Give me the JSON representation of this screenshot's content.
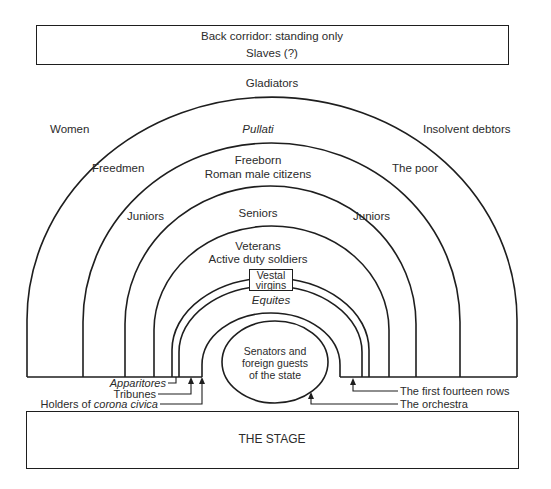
{
  "top_box": {
    "line1": "Back corridor: standing only",
    "line2": "Slaves (?)"
  },
  "tiers": {
    "outer_top": "Gladiators",
    "outer_left": "Women",
    "outer_center": "Pullati",
    "outer_right": "Insolvent debtors",
    "second_left": "Freedmen",
    "second_center_line1": "Freeborn",
    "second_center_line2": "Roman male citizens",
    "second_right": "The poor",
    "third_left": "Juniors",
    "third_center": "Seniors",
    "third_right": "Juniors",
    "fourth_center_line1": "Veterans",
    "fourth_center_line2": "Active duty soldiers",
    "vestal_line1": "Vestal",
    "vestal_line2": "virgins",
    "equites": "Equites"
  },
  "orchestra": {
    "line1": "Senators and",
    "line2": "foreign guests",
    "line3": "of the state"
  },
  "callouts_left": {
    "apparitores": "Apparitores",
    "tribunes": "Tribunes",
    "corona_prefix": "Holders of ",
    "corona_italic": "corona civica"
  },
  "callouts_right": {
    "first_fourteen": "The first fourteen rows",
    "orchestra": "The orchestra"
  },
  "stage": {
    "label": "THE STAGE"
  }
}
